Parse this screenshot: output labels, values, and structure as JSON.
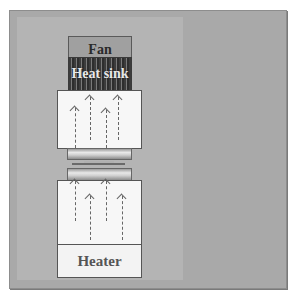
{
  "diagram": {
    "type": "thermal test stack schematic",
    "labels": {
      "fan": "Fan",
      "heat_sink": "Heat sink",
      "heater": "Heater"
    },
    "components_top_to_bottom": [
      "Fan",
      "Heat sink",
      "Upper meter block",
      "Upper cylinder",
      "Contact interface",
      "Lower cylinder",
      "Lower meter block",
      "Heater"
    ],
    "heat_flow_direction": "upward",
    "arrows": {
      "upper_block": [
        {
          "x": 75,
          "y_start": 148,
          "y_end": 108
        },
        {
          "x": 90,
          "y_start": 140,
          "y_end": 97
        },
        {
          "x": 106,
          "y_start": 148,
          "y_end": 110
        },
        {
          "x": 118,
          "y_start": 140,
          "y_end": 97
        }
      ],
      "lower_block": [
        {
          "x": 75,
          "y_start": 221,
          "y_end": 181
        },
        {
          "x": 90,
          "y_start": 240,
          "y_end": 196
        },
        {
          "x": 106,
          "y_start": 221,
          "y_end": 181
        },
        {
          "x": 122,
          "y_start": 240,
          "y_end": 196
        }
      ]
    },
    "colors": {
      "background_dark": "#a9a9a9",
      "background_light": "#b4b4b4",
      "fan": "#a0a0a0",
      "heat_sink": "#3c3c3c",
      "blocks": "#f7f7f7",
      "arrows": "#666666"
    }
  }
}
